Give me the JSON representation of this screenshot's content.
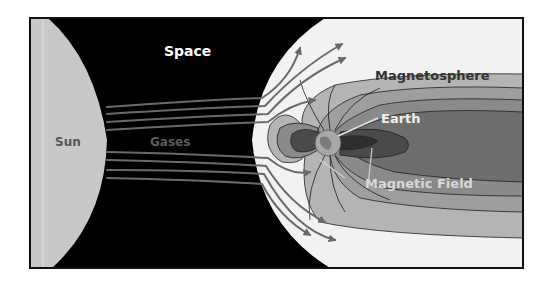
{
  "diagram": {
    "labels": {
      "space": "Space",
      "sun": "Sun",
      "gases": "Gases",
      "magnetosphere": "Magnetosphere",
      "earth": "Earth",
      "magnetic_field": "Magnetic Field"
    },
    "colors": {
      "space": "#000000",
      "sun": "#c8c8c8",
      "sheath": "#f2f2f2",
      "band_outer": "#b4b4b4",
      "band_2": "#9e9e9e",
      "band_3": "#8a8a8a",
      "band_inner": "#6e6e6e",
      "core": "#4a4a4a",
      "core_dark": "#2e2e2e",
      "earth": "#a8a8a8",
      "arrow": "#6a6a6a",
      "frame": "#111111"
    }
  }
}
